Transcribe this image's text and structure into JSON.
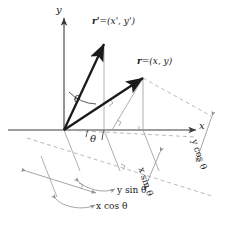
{
  "figure": {
    "kind": "vector-rotation-diagram",
    "colors": {
      "vector": "#1a1a1a",
      "axis": "#3c3c3c",
      "thin": "#9a9a9a",
      "dashed": "#a8a8a8",
      "text": "#1a1a1a"
    }
  },
  "axes": {
    "y_label": "y",
    "x_label": "x"
  },
  "vectors": [
    {
      "name": "r-prime",
      "label": "r'",
      "equals": "=",
      "components": "(x', y')"
    },
    {
      "name": "r",
      "label": "r",
      "equals": "=",
      "components": "(x, y)"
    }
  ],
  "angles": {
    "between_vectors": "θ",
    "below_axis": "θ"
  },
  "dimensions": [
    {
      "name": "y-cos-theta",
      "label": "y cos θ"
    },
    {
      "name": "x-sin-theta",
      "label": "x sin θ"
    },
    {
      "name": "y-sin-theta",
      "label": "y sin θ"
    },
    {
      "name": "x-cos-theta",
      "label": "x cos θ"
    }
  ]
}
